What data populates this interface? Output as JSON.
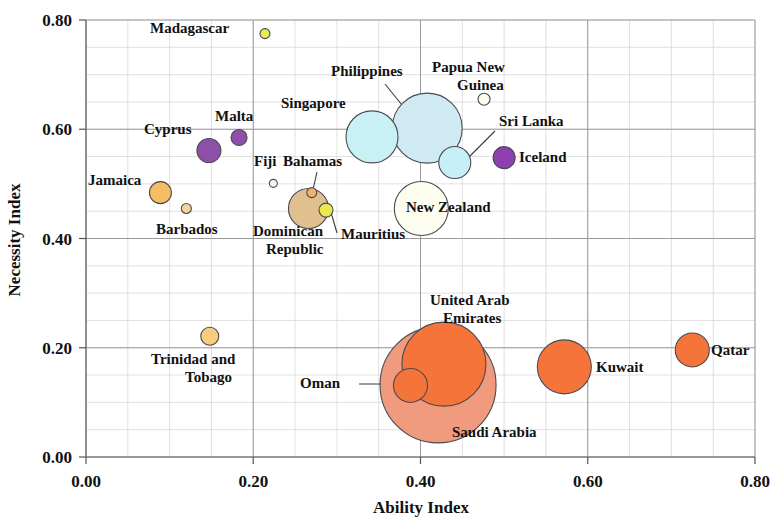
{
  "chart_data": {
    "type": "scatter",
    "title": "",
    "xlabel": "Ability Index",
    "ylabel": "Necessity Index",
    "xlim": [
      0.0,
      0.8
    ],
    "ylim": [
      0.0,
      0.8
    ],
    "xticks": [
      "0.00",
      "0.20",
      "0.40",
      "0.60",
      "0.80"
    ],
    "yticks": [
      "0.00",
      "0.20",
      "0.40",
      "0.60",
      "0.80"
    ],
    "xtick_values": [
      0.0,
      0.2,
      0.4,
      0.6,
      0.8
    ],
    "ytick_values": [
      0.0,
      0.2,
      0.4,
      0.6,
      0.8
    ],
    "grid": true,
    "grid_minor_step": 0.05,
    "legend": "none",
    "bubble_note": "bubble area encodes a third variable (size)",
    "points": [
      {
        "name": "Madagascar",
        "x": 0.214,
        "y": 0.775,
        "r": 5,
        "color": "#e8e85c",
        "label_x": 150,
        "label_y": 33,
        "label_anchor": "start",
        "leader": null
      },
      {
        "name": "Papua New Guinea",
        "x": 0.476,
        "y": 0.655,
        "r": 6,
        "color": "#fdfdf2",
        "label_x": 432,
        "label_y": 72,
        "label_anchor": "start",
        "label_line2": "Guinea",
        "label2_x": 457,
        "label2_y": 90,
        "leader": null
      },
      {
        "name": "Philippines",
        "x": 0.408,
        "y": 0.602,
        "r": 35,
        "color": "#cfeaf3",
        "label_x": 331,
        "label_y": 76,
        "label_anchor": "start",
        "leader": [
          385,
          84,
          427,
          136
        ]
      },
      {
        "name": "Singapore",
        "x": 0.342,
        "y": 0.586,
        "r": 26,
        "color": "#c8f0f5",
        "label_x": 281,
        "label_y": 108,
        "label_anchor": "start",
        "leader": null
      },
      {
        "name": "Malta",
        "x": 0.183,
        "y": 0.585,
        "r": 8,
        "color": "#8e4fa8",
        "label_x": 215,
        "label_y": 121,
        "label_anchor": "start",
        "leader": null
      },
      {
        "name": "Cyprus",
        "x": 0.147,
        "y": 0.561,
        "r": 12,
        "color": "#8e4fa8",
        "label_x": 144,
        "label_y": 134,
        "label_anchor": "start",
        "leader": null
      },
      {
        "name": "Sri Lanka",
        "x": 0.441,
        "y": 0.539,
        "r": 16,
        "color": "#c8eef7",
        "label_x": 499,
        "label_y": 126,
        "label_anchor": "start",
        "leader": [
          495,
          131,
          462,
          164
        ]
      },
      {
        "name": "Iceland",
        "x": 0.5,
        "y": 0.548,
        "r": 11,
        "color": "#8e3fb0",
        "label_x": 519,
        "label_y": 162,
        "label_anchor": "start",
        "leader": null
      },
      {
        "name": "Fiji",
        "x": 0.224,
        "y": 0.501,
        "r": 4,
        "color": "#f4f4f8",
        "label_x": 254,
        "label_y": 166,
        "label_anchor": "start",
        "leader": null
      },
      {
        "name": "Bahamas",
        "x": 0.27,
        "y": 0.484,
        "r": 5,
        "color": "#f0b36a",
        "label_x": 283,
        "label_y": 166,
        "label_anchor": "start",
        "leader": [
          317,
          172,
          312,
          194
        ]
      },
      {
        "name": "Jamaica",
        "x": 0.089,
        "y": 0.484,
        "r": 11,
        "color": "#f6bd62",
        "label_x": 88,
        "label_y": 185,
        "label_anchor": "start",
        "leader": null
      },
      {
        "name": "New Zealand",
        "x": 0.401,
        "y": 0.455,
        "r": 27,
        "color": "#fdfdf0",
        "label_x": 406,
        "label_y": 212,
        "label_anchor": "start",
        "leader": null
      },
      {
        "name": "Dominican Republic",
        "x": 0.266,
        "y": 0.455,
        "r": 20,
        "color": "#e0c08e",
        "label_x": 253,
        "label_y": 236,
        "label_anchor": "start",
        "label_line2": "Republic",
        "label2_x": 266,
        "label2_y": 254,
        "leader": null
      },
      {
        "name": "Barbados",
        "x": 0.12,
        "y": 0.455,
        "r": 5,
        "color": "#f6d39a",
        "label_x": 156,
        "label_y": 234,
        "label_anchor": "start",
        "leader": null
      },
      {
        "name": "Mauritius",
        "x": 0.287,
        "y": 0.452,
        "r": 7,
        "color": "#ebe84a",
        "label_x": 341,
        "label_y": 239,
        "label_anchor": "start",
        "leader": [
          337,
          233,
          330,
          209
        ]
      },
      {
        "name": "Trinidad and Tobago",
        "x": 0.148,
        "y": 0.221,
        "r": 9,
        "color": "#f8cb7e",
        "label_x": 151,
        "label_y": 364,
        "label_anchor": "start",
        "label_line2": "Tobago",
        "label2_x": 185,
        "label2_y": 382,
        "leader": null
      },
      {
        "name": "Saudi Arabia",
        "x": 0.421,
        "y": 0.132,
        "r": 58,
        "color": "#f09a7e",
        "label_x": 452,
        "label_y": 437,
        "label_anchor": "start",
        "leader": null
      },
      {
        "name": "United Arab Emirates",
        "x": 0.428,
        "y": 0.17,
        "r": 42,
        "color": "#f4743a",
        "label_x": 430,
        "label_y": 305,
        "label_anchor": "start",
        "label_line2": "Emirates",
        "label2_x": 443,
        "label2_y": 323,
        "leader": null
      },
      {
        "name": "Oman",
        "x": 0.388,
        "y": 0.131,
        "r": 17,
        "color": "#f4743a",
        "label_x": 300,
        "label_y": 388,
        "label_anchor": "start",
        "leader": [
          359,
          384,
          400,
          384
        ]
      },
      {
        "name": "Kuwait",
        "x": 0.572,
        "y": 0.165,
        "r": 27,
        "color": "#f4743a",
        "label_x": 596,
        "label_y": 372,
        "label_anchor": "start",
        "leader": null
      },
      {
        "name": "Qatar",
        "x": 0.725,
        "y": 0.196,
        "r": 17,
        "color": "#f4743a",
        "label_x": 711,
        "label_y": 355,
        "label_anchor": "start",
        "leader": null
      }
    ]
  },
  "axes": {
    "x_title": "Ability Index",
    "y_title": "Necessity Index"
  }
}
